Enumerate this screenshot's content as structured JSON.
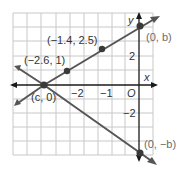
{
  "diagram": {
    "type": "coordinate-plane-graph",
    "axes": {
      "x_label": "x",
      "y_label": "y",
      "origin_label": "O",
      "x_tick_labels": [
        "−2",
        "−1"
      ],
      "y_tick_labels": [
        "2",
        "−2"
      ]
    },
    "lines": [
      {
        "name": "line-through-cb",
        "description": "Line rising from (c, 0) through (−2.6, 1) and (−1.4, 2.5) to (0, b)"
      },
      {
        "name": "line-through-c-negb",
        "description": "Line falling from (c, 0) to (0, −b)"
      }
    ],
    "points": [
      {
        "label": "(−2.6, 1)"
      },
      {
        "label": "(−1.4, 2.5)"
      },
      {
        "label": "(c, 0)"
      },
      {
        "label": "(0, b)"
      },
      {
        "label": "(0, −b)"
      }
    ],
    "colors": {
      "grid": "#c8c8c8",
      "axis": "#1a1a1a",
      "line": "#555555",
      "point": "#3a3a3a",
      "label": "#333333",
      "label_gray": "#6b6b6b"
    }
  }
}
